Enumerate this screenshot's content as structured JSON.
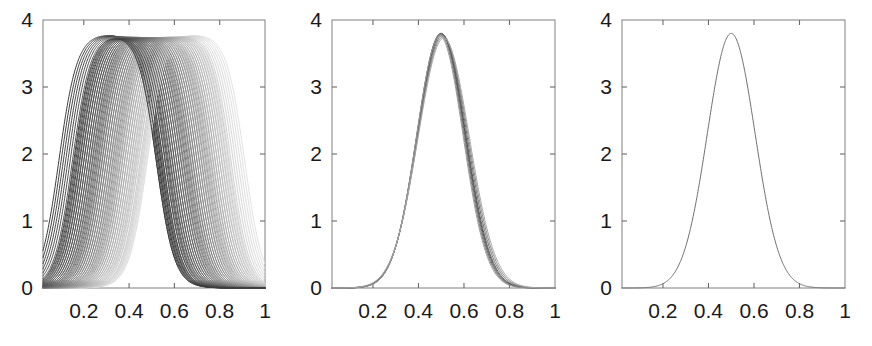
{
  "figure": {
    "kind": "multi-panel-line-plot",
    "panel_count": 3,
    "background_color": "#ffffff",
    "frame_color": "#8a8a8a",
    "tick_label_color": "#1a1a1a",
    "curve_color": "#707070"
  },
  "panels": [
    {
      "id": "panel-left",
      "name": "panel-left",
      "description": "Family of saturating plateau curves fanning out and crossing near x=0.5",
      "curve_count": 40,
      "plateau_value": 3.8,
      "x_ticks": [
        "0.2",
        "0.4",
        "0.6",
        "0.8",
        "1"
      ],
      "y_ticks": [
        "0",
        "1",
        "2",
        "3",
        "4"
      ]
    },
    {
      "id": "panel-middle",
      "name": "panel-middle",
      "description": "Several nearly coincident Gaussian curves peaking at x=0.5",
      "curve_count": 8,
      "peak_value": 3.8,
      "peak_x": 0.5,
      "x_ticks": [
        "0.2",
        "0.4",
        "0.6",
        "0.8",
        "1"
      ],
      "y_ticks": [
        "0",
        "1",
        "2",
        "3",
        "4"
      ]
    },
    {
      "id": "panel-right",
      "name": "panel-right",
      "description": "Single smooth Gaussian curve peaking at x=0.5",
      "curve_count": 1,
      "peak_value": 3.8,
      "peak_x": 0.5,
      "x_ticks": [
        "0.2",
        "0.4",
        "0.6",
        "0.8",
        "1"
      ],
      "y_ticks": [
        "0",
        "1",
        "2",
        "3",
        "4"
      ]
    }
  ],
  "chart_data": [
    {
      "type": "line",
      "panel": "left",
      "title": "",
      "xlabel": "",
      "ylabel": "",
      "xlim": [
        0.02,
        1.0
      ],
      "ylim": [
        0,
        4
      ],
      "xticks": [
        0.2,
        0.4,
        0.6,
        0.8,
        1.0
      ],
      "xticklabels": [
        "0.2",
        "0.4",
        "0.6",
        "0.8",
        "1"
      ],
      "yticks": [
        0,
        1,
        2,
        3,
        4
      ],
      "yticklabels": [
        "0",
        "1",
        "2",
        "3",
        "4"
      ],
      "grid": false,
      "legend": false,
      "n_series": 40,
      "series_description": "Each curve is a clipped / saturating bump: rises from 0, plateaus at 3.8, falls back to 0. Successive curves are progressively shifted right and lightened in gray value, producing a crossing fan whose descending branches converge near x=0.5.",
      "plateau_value": 3.8,
      "baseline_value": 0.0,
      "convergence_x": 0.5,
      "gray_range": [
        "#3c3c3c",
        "#e2e2e2"
      ],
      "series_params": [
        {
          "rise_center": 0.09,
          "fall_center": 0.52,
          "width": 0.04,
          "gray": "#3c3c3c"
        },
        {
          "rise_center": 0.1,
          "fall_center": 0.525,
          "width": 0.04,
          "gray": "#404040"
        },
        {
          "rise_center": 0.11,
          "fall_center": 0.53,
          "width": 0.04,
          "gray": "#444444"
        },
        {
          "rise_center": 0.12,
          "fall_center": 0.535,
          "width": 0.04,
          "gray": "#484848"
        },
        {
          "rise_center": 0.13,
          "fall_center": 0.54,
          "width": 0.04,
          "gray": "#4c4c4c"
        },
        {
          "rise_center": 0.14,
          "fall_center": 0.545,
          "width": 0.04,
          "gray": "#505050"
        },
        {
          "rise_center": 0.15,
          "fall_center": 0.55,
          "width": 0.04,
          "gray": "#545454"
        },
        {
          "rise_center": 0.16,
          "fall_center": 0.558,
          "width": 0.04,
          "gray": "#585858"
        },
        {
          "rise_center": 0.17,
          "fall_center": 0.566,
          "width": 0.04,
          "gray": "#5c5c5c"
        },
        {
          "rise_center": 0.18,
          "fall_center": 0.574,
          "width": 0.04,
          "gray": "#616161"
        },
        {
          "rise_center": 0.19,
          "fall_center": 0.583,
          "width": 0.04,
          "gray": "#656565"
        },
        {
          "rise_center": 0.2,
          "fall_center": 0.592,
          "width": 0.04,
          "gray": "#6a6a6a"
        },
        {
          "rise_center": 0.21,
          "fall_center": 0.601,
          "width": 0.04,
          "gray": "#6e6e6e"
        },
        {
          "rise_center": 0.22,
          "fall_center": 0.61,
          "width": 0.04,
          "gray": "#737373"
        },
        {
          "rise_center": 0.23,
          "fall_center": 0.619,
          "width": 0.04,
          "gray": "#777777"
        },
        {
          "rise_center": 0.24,
          "fall_center": 0.628,
          "width": 0.04,
          "gray": "#7c7c7c"
        },
        {
          "rise_center": 0.25,
          "fall_center": 0.637,
          "width": 0.04,
          "gray": "#808080"
        },
        {
          "rise_center": 0.26,
          "fall_center": 0.646,
          "width": 0.04,
          "gray": "#858585"
        },
        {
          "rise_center": 0.27,
          "fall_center": 0.655,
          "width": 0.04,
          "gray": "#898989"
        },
        {
          "rise_center": 0.28,
          "fall_center": 0.664,
          "width": 0.04,
          "gray": "#8e8e8e"
        },
        {
          "rise_center": 0.29,
          "fall_center": 0.673,
          "width": 0.04,
          "gray": "#929292"
        },
        {
          "rise_center": 0.3,
          "fall_center": 0.682,
          "width": 0.04,
          "gray": "#979797"
        },
        {
          "rise_center": 0.31,
          "fall_center": 0.691,
          "width": 0.04,
          "gray": "#9b9b9b"
        },
        {
          "rise_center": 0.32,
          "fall_center": 0.7,
          "width": 0.04,
          "gray": "#a0a0a0"
        },
        {
          "rise_center": 0.33,
          "fall_center": 0.709,
          "width": 0.04,
          "gray": "#a4a4a4"
        },
        {
          "rise_center": 0.34,
          "fall_center": 0.718,
          "width": 0.04,
          "gray": "#a9a9a9"
        },
        {
          "rise_center": 0.35,
          "fall_center": 0.727,
          "width": 0.04,
          "gray": "#adadad"
        },
        {
          "rise_center": 0.36,
          "fall_center": 0.736,
          "width": 0.04,
          "gray": "#b2b2b2"
        },
        {
          "rise_center": 0.37,
          "fall_center": 0.745,
          "width": 0.04,
          "gray": "#b6b6b6"
        },
        {
          "rise_center": 0.38,
          "fall_center": 0.754,
          "width": 0.04,
          "gray": "#bbbbbb"
        },
        {
          "rise_center": 0.39,
          "fall_center": 0.763,
          "width": 0.04,
          "gray": "#bfbfbf"
        },
        {
          "rise_center": 0.4,
          "fall_center": 0.772,
          "width": 0.04,
          "gray": "#c4c4c4"
        },
        {
          "rise_center": 0.41,
          "fall_center": 0.781,
          "width": 0.04,
          "gray": "#c8c8c8"
        },
        {
          "rise_center": 0.42,
          "fall_center": 0.79,
          "width": 0.04,
          "gray": "#cdcdcd"
        },
        {
          "rise_center": 0.43,
          "fall_center": 0.799,
          "width": 0.04,
          "gray": "#d1d1d1"
        },
        {
          "rise_center": 0.44,
          "fall_center": 0.808,
          "width": 0.04,
          "gray": "#d6d6d6"
        },
        {
          "rise_center": 0.45,
          "fall_center": 0.817,
          "width": 0.04,
          "gray": "#dadada"
        },
        {
          "rise_center": 0.46,
          "fall_center": 0.826,
          "width": 0.04,
          "gray": "#dddddd"
        },
        {
          "rise_center": 0.47,
          "fall_center": 0.835,
          "width": 0.04,
          "gray": "#e0e0e0"
        },
        {
          "rise_center": 0.48,
          "fall_center": 0.844,
          "width": 0.04,
          "gray": "#e2e2e2"
        }
      ]
    },
    {
      "type": "line",
      "panel": "middle",
      "title": "",
      "xlabel": "",
      "ylabel": "",
      "xlim": [
        0.02,
        1.0
      ],
      "ylim": [
        0,
        4
      ],
      "xticks": [
        0.2,
        0.4,
        0.6,
        0.8,
        1.0
      ],
      "xticklabels": [
        "0.2",
        "0.4",
        "0.6",
        "0.8",
        "1"
      ],
      "yticks": [
        0,
        1,
        2,
        3,
        4
      ],
      "yticklabels": [
        "0",
        "1",
        "2",
        "3",
        "4"
      ],
      "grid": false,
      "legend": false,
      "n_series": 8,
      "series_description": "Eight nearly coincident Gaussian density curves, all peaking at 3.8 near x=0.5 with slight variation in width and center.",
      "series_params": [
        {
          "mu": 0.5,
          "sigma": 0.105,
          "peak": 3.8,
          "gray": "#4a4a4a"
        },
        {
          "mu": 0.502,
          "sigma": 0.106,
          "peak": 3.79,
          "gray": "#555555"
        },
        {
          "mu": 0.498,
          "sigma": 0.104,
          "peak": 3.8,
          "gray": "#606060"
        },
        {
          "mu": 0.505,
          "sigma": 0.108,
          "peak": 3.77,
          "gray": "#6d6d6d"
        },
        {
          "mu": 0.496,
          "sigma": 0.103,
          "peak": 3.78,
          "gray": "#7a7a7a"
        },
        {
          "mu": 0.508,
          "sigma": 0.11,
          "peak": 3.75,
          "gray": "#888888"
        },
        {
          "mu": 0.494,
          "sigma": 0.102,
          "peak": 3.76,
          "gray": "#979797"
        },
        {
          "mu": 0.511,
          "sigma": 0.112,
          "peak": 3.73,
          "gray": "#a6a6a6"
        }
      ]
    },
    {
      "type": "line",
      "panel": "right",
      "title": "",
      "xlabel": "",
      "ylabel": "",
      "xlim": [
        0.02,
        1.0
      ],
      "ylim": [
        0,
        4
      ],
      "xticks": [
        0.2,
        0.4,
        0.6,
        0.8,
        1.0
      ],
      "xticklabels": [
        "0.2",
        "0.4",
        "0.6",
        "0.8",
        "1"
      ],
      "yticks": [
        0,
        1,
        2,
        3,
        4
      ],
      "yticklabels": [
        "0",
        "1",
        "2",
        "3",
        "4"
      ],
      "grid": false,
      "legend": false,
      "n_series": 1,
      "series_description": "A single smooth Gaussian density curve peaking at 3.8 at x=0.5.",
      "series_params": [
        {
          "mu": 0.5,
          "sigma": 0.105,
          "peak": 3.8,
          "gray": "#707070"
        }
      ]
    }
  ]
}
